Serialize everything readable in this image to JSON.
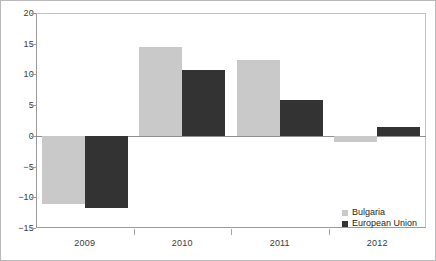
{
  "chart_data": {
    "type": "bar",
    "title": "",
    "subtitle": "",
    "xlabel": "",
    "ylabel": "",
    "categories": [
      "2009",
      "2010",
      "2011",
      "2012"
    ],
    "series": [
      {
        "name": "Bulgaria",
        "color": "#c9c9c9",
        "values": [
          -11.1,
          14.5,
          12.4,
          -1.0
        ]
      },
      {
        "name": "European Union",
        "color": "#333333",
        "values": [
          -11.8,
          10.7,
          5.8,
          1.4
        ]
      }
    ],
    "ylim": [
      -15,
      20
    ],
    "yticks": [
      20,
      15,
      10,
      5,
      0,
      -5,
      -10,
      -15
    ],
    "ytick_labels": [
      "20",
      "15",
      "10",
      "5",
      "0",
      "−5",
      "−10",
      "−15"
    ],
    "grid": false,
    "zero_line": true,
    "legend": {
      "position": "bottom-right",
      "entries": [
        "Bulgaria",
        "European Union"
      ]
    }
  },
  "colors": {
    "series_bulgaria": "#c9c9c9",
    "series_european_union": "#333333",
    "axis": "#9a9a9a",
    "frame": "#b9b9b9",
    "text": "#231f20",
    "background": "#ffffff"
  }
}
